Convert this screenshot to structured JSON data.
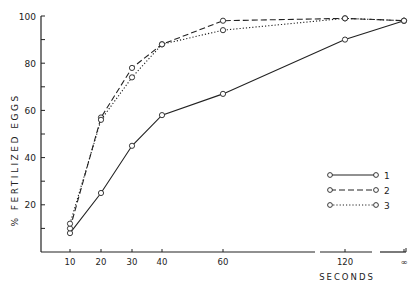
{
  "chart_data": {
    "type": "line",
    "title": "",
    "xlabel": "SECONDS",
    "ylabel": "% FERTILIZED EGGS",
    "x_tick_labels": [
      "10",
      "20",
      "30",
      "40",
      "60",
      "120",
      "∞"
    ],
    "y_tick_labels": [
      "20",
      "40",
      "60",
      "80",
      "100"
    ],
    "ylim": [
      0,
      100
    ],
    "grid": false,
    "legend_position": "lower right",
    "x": [
      "10",
      "20",
      "30",
      "40",
      "60",
      "120",
      "∞"
    ],
    "series": [
      {
        "name": "1",
        "style": "solid",
        "values": [
          8,
          25,
          45,
          58,
          67,
          90,
          98
        ]
      },
      {
        "name": "2",
        "style": "dashed",
        "values": [
          10,
          57,
          78,
          88,
          98,
          99,
          98
        ]
      },
      {
        "name": "3",
        "style": "dotted",
        "values": [
          12,
          56,
          74,
          88,
          94,
          99,
          98
        ]
      }
    ]
  },
  "legend": [
    {
      "label": "1"
    },
    {
      "label": "2"
    },
    {
      "label": "3"
    }
  ],
  "colors": {
    "ink": "#222222",
    "background": "#ffffff"
  }
}
